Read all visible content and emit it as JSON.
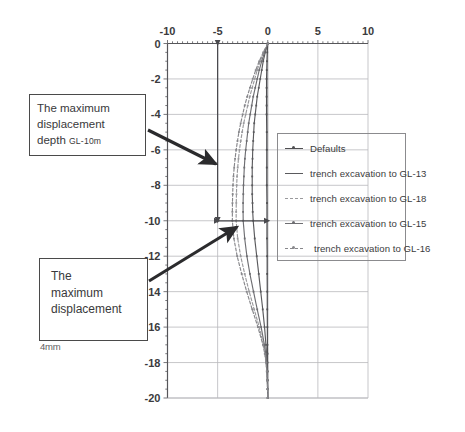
{
  "figure": {
    "background": "#ffffff",
    "scale_note": "4mm"
  },
  "annotations": [
    {
      "id": "max-displacement-depth",
      "line1": "The maximum",
      "line2": "displacement",
      "line3": "depth ",
      "line3_emphasis": "GL-10m",
      "arrow_from": [
        148,
        130
      ],
      "arrow_to": [
        216,
        164
      ]
    },
    {
      "id": "max-displacement",
      "line1": "The",
      "line2": "maximum",
      "line3": "displacement",
      "arrow_from": [
        149,
        281
      ],
      "arrow_to": [
        237,
        227
      ]
    }
  ],
  "legend": {
    "position": "inside-right",
    "entries": [
      {
        "label": "Defaults",
        "color": "#4f4f52",
        "dash": "2,0",
        "marker": true
      },
      {
        "label": "trench excavation to GL-13",
        "color": "#5a5a5d",
        "dash": "2,0",
        "marker": false
      },
      {
        "label": "trench excavation to GL-18",
        "color": "#9a9a9d",
        "dash": "3,2",
        "marker": false
      },
      {
        "label": "trench excavation to GL-15",
        "color": "#6e6e72",
        "dash": "2,0",
        "marker": true
      },
      {
        "label": "trench excavation to GL-16",
        "color": "#87878b",
        "dash": "3,2",
        "marker": true
      }
    ]
  },
  "chart_data": {
    "type": "line",
    "title": "",
    "xlabel": "",
    "ylabel": "",
    "xlim": [
      -10,
      10
    ],
    "ylim": [
      -20,
      0
    ],
    "xticks": [
      -10,
      -5,
      0,
      5,
      10
    ],
    "xtick_labels": [
      "-10",
      "-5",
      "0",
      "5",
      "10"
    ],
    "yticks": [
      0,
      -2,
      -4,
      -6,
      -8,
      -10,
      -12,
      -14,
      -16,
      -18,
      -20
    ],
    "ytick_labels": [
      "0",
      "-2",
      "-4",
      "-6",
      "-8",
      "-10",
      "-12",
      "-14",
      "-16",
      "-18",
      "-20"
    ],
    "grid": true,
    "x_axis_position": "top",
    "orientation": "depth-profile",
    "measure_lines": [
      {
        "name": "max-depth-vertical",
        "x": -5,
        "y_from": 0,
        "y_to": -10,
        "arrows": "both"
      },
      {
        "name": "max-displacement-horizontal",
        "y": -10,
        "x_from": -5,
        "x_to": 0,
        "arrows": "both"
      }
    ],
    "series": [
      {
        "name": "Defaults",
        "color": "#4f4f52",
        "dash": "2,0",
        "y": [
          0,
          -0.5,
          -1,
          -1.5,
          -2,
          -2.5,
          -3,
          -3.5,
          -4,
          -5,
          -6,
          -7,
          -8,
          -9,
          -10,
          -11,
          -12,
          -13,
          -14,
          -15,
          -16,
          -17,
          -17.5,
          -18,
          -18.5,
          -19,
          -19.5,
          -20
        ],
        "x": [
          0,
          -0.05,
          -0.08,
          -0.1,
          -0.12,
          -0.12,
          -0.12,
          -0.12,
          -0.12,
          -0.1,
          -0.1,
          -0.1,
          -0.1,
          -0.08,
          -0.08,
          -0.08,
          -0.06,
          -0.06,
          -0.05,
          -0.05,
          -0.04,
          -0.03,
          -0.02,
          -0.02,
          -0.01,
          -0.01,
          0,
          0
        ]
      },
      {
        "name": "trench excavation to GL-13",
        "color": "#5a5a5d",
        "dash": "2,0",
        "y": [
          0,
          -0.5,
          -1,
          -1.5,
          -2,
          -2.5,
          -3,
          -3.5,
          -4,
          -4.5,
          -5,
          -5.5,
          -6,
          -6.5,
          -7,
          -7.5,
          -8,
          -8.5,
          -9,
          -9.5,
          -10,
          -11,
          -12,
          -13,
          -14,
          -15,
          -16,
          -17,
          -17.5,
          -18,
          -18.5,
          -19,
          -19.5,
          -20
        ],
        "x": [
          0,
          -0.25,
          -0.45,
          -0.6,
          -0.75,
          -0.9,
          -1.05,
          -1.15,
          -1.25,
          -1.35,
          -1.4,
          -1.45,
          -1.5,
          -1.52,
          -1.55,
          -1.55,
          -1.55,
          -1.55,
          -1.52,
          -1.5,
          -1.45,
          -1.3,
          -1.1,
          -0.9,
          -0.7,
          -0.5,
          -0.32,
          -0.18,
          -0.12,
          -0.08,
          -0.05,
          -0.03,
          -0.01,
          0
        ]
      },
      {
        "name": "trench excavation to GL-18",
        "color": "#9a9a9d",
        "dash": "3,2",
        "y": [
          0,
          -0.5,
          -1,
          -1.5,
          -2,
          -2.5,
          -3,
          -3.5,
          -4,
          -4.5,
          -5,
          -5.5,
          -6,
          -6.5,
          -7,
          -7.5,
          -8,
          -8.5,
          -9,
          -9.5,
          -10,
          -11,
          -12,
          -13,
          -14,
          -15,
          -16,
          -17,
          -17.5,
          -18,
          -18.5,
          -19,
          -19.5,
          -20
        ],
        "x": [
          0,
          -0.4,
          -0.75,
          -1.05,
          -1.3,
          -1.55,
          -1.8,
          -2.0,
          -2.2,
          -2.4,
          -2.55,
          -2.7,
          -2.82,
          -2.92,
          -3.0,
          -3.06,
          -3.1,
          -3.12,
          -3.14,
          -3.15,
          -3.15,
          -3.0,
          -2.7,
          -2.3,
          -1.85,
          -1.35,
          -0.85,
          -0.42,
          -0.26,
          -0.16,
          -0.09,
          -0.05,
          -0.02,
          0
        ]
      },
      {
        "name": "trench excavation to GL-15",
        "color": "#6e6e72",
        "dash": "2,0",
        "y": [
          0,
          -0.5,
          -1,
          -1.5,
          -2,
          -2.5,
          -3,
          -3.5,
          -4,
          -4.5,
          -5,
          -5.5,
          -6,
          -6.5,
          -7,
          -7.5,
          -8,
          -8.5,
          -9,
          -9.5,
          -10,
          -11,
          -12,
          -13,
          -14,
          -15,
          -16,
          -17,
          -17.5,
          -18,
          -18.5,
          -19,
          -19.5,
          -20
        ],
        "x": [
          0,
          -0.32,
          -0.6,
          -0.85,
          -1.05,
          -1.25,
          -1.45,
          -1.6,
          -1.75,
          -1.9,
          -2.0,
          -2.1,
          -2.2,
          -2.28,
          -2.34,
          -2.38,
          -2.42,
          -2.44,
          -2.46,
          -2.46,
          -2.45,
          -2.3,
          -2.08,
          -1.78,
          -1.42,
          -1.05,
          -0.66,
          -0.33,
          -0.2,
          -0.12,
          -0.07,
          -0.04,
          -0.015,
          0
        ]
      },
      {
        "name": "trench excavation to GL-16",
        "color": "#87878b",
        "dash": "3,2",
        "y": [
          0,
          -0.5,
          -1,
          -1.5,
          -2,
          -2.5,
          -3,
          -3.5,
          -4,
          -4.5,
          -5,
          -5.5,
          -6,
          -6.5,
          -7,
          -7.5,
          -8,
          -8.5,
          -9,
          -9.5,
          -10,
          -11,
          -12,
          -13,
          -14,
          -15,
          -16,
          -17,
          -17.5,
          -18,
          -18.5,
          -19,
          -19.5,
          -20
        ],
        "x": [
          0,
          -0.45,
          -0.85,
          -1.2,
          -1.5,
          -1.78,
          -2.05,
          -2.3,
          -2.5,
          -2.7,
          -2.88,
          -3.02,
          -3.15,
          -3.26,
          -3.35,
          -3.42,
          -3.47,
          -3.5,
          -3.52,
          -3.53,
          -3.53,
          -3.38,
          -3.05,
          -2.6,
          -2.1,
          -1.55,
          -0.98,
          -0.48,
          -0.3,
          -0.18,
          -0.1,
          -0.055,
          -0.02,
          0
        ]
      }
    ]
  }
}
